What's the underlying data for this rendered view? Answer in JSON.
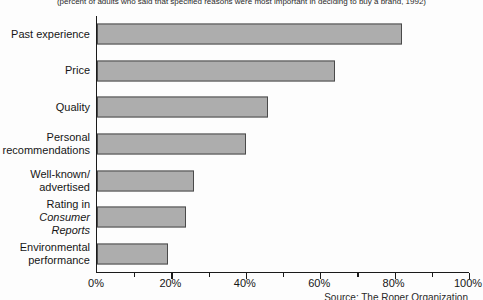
{
  "colors": {
    "bar_fill": "#adadad",
    "bar_border": "#4a4a4a",
    "axis": "#1a1a1a"
  },
  "chart_data": {
    "type": "bar",
    "orientation": "horizontal",
    "subtitle": "(percent of adults who said that specified reasons were most important in deciding to buy a brand, 1992)",
    "source": "Source: The Roper Organization",
    "categories": [
      "Past experience",
      "Price",
      "Quality",
      "Personal recommendations",
      "Well-known/advertised",
      "Rating in Consumer Reports",
      "Environmental performance"
    ],
    "values": [
      82,
      64,
      46,
      40,
      26,
      24,
      19
    ],
    "label_lines": [
      [
        {
          "text": "Past experience",
          "italic": false
        }
      ],
      [
        {
          "text": "Price",
          "italic": false
        }
      ],
      [
        {
          "text": "Quality",
          "italic": false
        }
      ],
      [
        {
          "text": "Personal",
          "italic": false
        },
        {
          "text": "recommendations",
          "italic": false
        }
      ],
      [
        {
          "text": "Well-known/",
          "italic": false
        },
        {
          "text": "advertised",
          "italic": false
        }
      ],
      [
        {
          "text": "Rating in",
          "italic": false
        },
        {
          "text": "Consumer Reports",
          "italic": true
        }
      ],
      [
        {
          "text": "Environmental",
          "italic": false
        },
        {
          "text": "performance",
          "italic": false
        }
      ]
    ],
    "xlim": [
      0,
      100
    ],
    "x_major_ticks": [
      0,
      20,
      40,
      60,
      80,
      100
    ],
    "x_tick_labels": [
      "0%",
      "20%",
      "40%",
      "60%",
      "80%",
      "100%"
    ],
    "x_minor_ticks": [
      10,
      30,
      50,
      70,
      90
    ],
    "grid": false,
    "legend": "none"
  }
}
